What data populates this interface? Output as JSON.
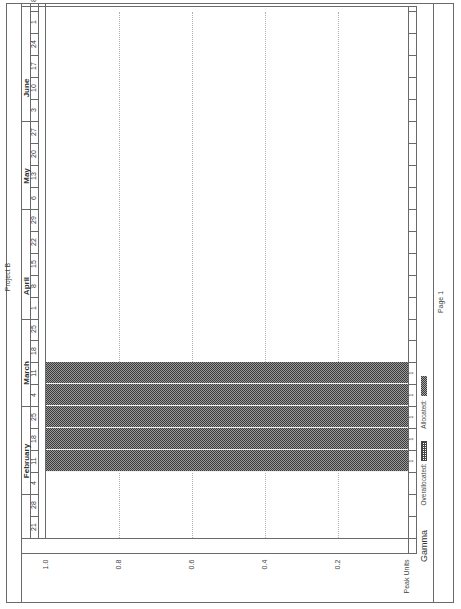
{
  "page": {
    "title": "Project B",
    "footer": "Page 1",
    "orientation": "landscape printed rotated 90deg"
  },
  "timescale": {
    "months": [
      {
        "label": "February"
      },
      {
        "label": "March"
      },
      {
        "label": "April"
      },
      {
        "label": "May"
      },
      {
        "label": "June"
      }
    ],
    "weeks": [
      "21",
      "28",
      "4",
      "11",
      "18",
      "25",
      "4",
      "11",
      "18",
      "25",
      "1",
      "8",
      "15",
      "22",
      "29",
      "6",
      "13",
      "20",
      "27",
      "3",
      "10",
      "17",
      "24",
      "1",
      "8"
    ]
  },
  "resource": {
    "name": "Gamma",
    "row_label": "Peak Units",
    "values": [
      "",
      "",
      "",
      "1",
      "1",
      "1",
      "1",
      "1",
      "",
      "",
      "",
      "",
      "",
      "",
      "",
      "",
      "",
      "",
      "",
      "",
      "",
      "",
      "",
      "",
      ""
    ]
  },
  "legend": {
    "overallocated_label": "Overallocated:",
    "allocated_label": "Allocated:"
  },
  "colors": {
    "allocated": "#5a5a5a",
    "gridline": "#b0b0b0",
    "frame": "#6a6a6a"
  },
  "chart_data": {
    "type": "bar",
    "title": "Project B",
    "resource": "Gamma",
    "xlabel": "Week",
    "ylabel": "Peak Units",
    "ylim": [
      0,
      1.0
    ],
    "yticks": [
      "1.0",
      "0.8",
      "0.6",
      "0.4",
      "0.2"
    ],
    "grid": true,
    "legend_position": "bottom",
    "legend": [
      "Overallocated",
      "Allocated"
    ],
    "categories": [
      "Jan 21",
      "Jan 28",
      "Feb 4",
      "Feb 11",
      "Feb 18",
      "Feb 25",
      "Mar 4",
      "Mar 11",
      "Mar 18",
      "Mar 25",
      "Apr 1",
      "Apr 8",
      "Apr 15",
      "Apr 22",
      "Apr 29",
      "May 6",
      "May 13",
      "May 20",
      "May 27",
      "Jun 3",
      "Jun 10",
      "Jun 17",
      "Jun 24",
      "Jul 1",
      "Jul 8"
    ],
    "series": [
      {
        "name": "Allocated",
        "values": [
          0,
          0,
          0,
          1,
          1,
          1,
          1,
          1,
          0,
          0,
          0,
          0,
          0,
          0,
          0,
          0,
          0,
          0,
          0,
          0,
          0,
          0,
          0,
          0,
          0
        ]
      },
      {
        "name": "Overallocated",
        "values": [
          0,
          0,
          0,
          0,
          0,
          0,
          0,
          0,
          0,
          0,
          0,
          0,
          0,
          0,
          0,
          0,
          0,
          0,
          0,
          0,
          0,
          0,
          0,
          0,
          0
        ]
      }
    ]
  }
}
